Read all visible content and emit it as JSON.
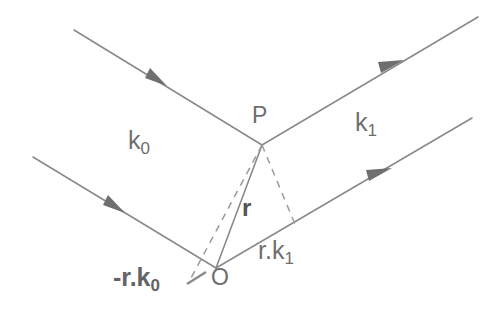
{
  "figure": {
    "type": "scattering-geometry-diagram",
    "background_color": "#ffffff",
    "line_color": "#8a8a8a",
    "text_color": "#6e6e6e"
  },
  "labels": {
    "incident_wavevector": {
      "base": "k",
      "sub": "0",
      "x": 128,
      "y": 128
    },
    "scattered_wavevector": {
      "base": "k",
      "sub": "1",
      "x": 355,
      "y": 110
    },
    "point_p": {
      "text": "P",
      "x": 252,
      "y": 104
    },
    "point_o": {
      "text": "O",
      "x": 211,
      "y": 266
    },
    "position_vector": {
      "text": "r",
      "x": 242,
      "y": 196
    },
    "path_diff_incident": {
      "base": "-r.k",
      "sub": "0",
      "x": 113,
      "y": 265
    },
    "path_diff_scattered": {
      "base": "r.k",
      "sub": "1",
      "x": 258,
      "y": 238
    }
  },
  "points": {
    "P": {
      "x": 262,
      "y": 145
    },
    "O": {
      "x": 216,
      "y": 268
    },
    "foot_incident": {
      "x": 190,
      "y": 280
    },
    "foot_scattered": {
      "x": 297,
      "y": 229
    }
  },
  "rays": [
    {
      "name": "incident-ray-upper",
      "x1": 74,
      "y1": 30,
      "x2": 262,
      "y2": 145,
      "arrow_t": 0.43,
      "style": "solid"
    },
    {
      "name": "scattered-ray-upper",
      "x1": 262,
      "y1": 145,
      "x2": 478,
      "y2": 17,
      "arrow_t": 0.6,
      "style": "solid"
    },
    {
      "name": "incident-ray-lower",
      "x1": 33,
      "y1": 157,
      "x2": 216,
      "y2": 268,
      "arrow_t": 0.43,
      "style": "solid"
    },
    {
      "name": "scattered-ray-lower",
      "x1": 216,
      "y1": 268,
      "x2": 472,
      "y2": 118,
      "arrow_t": 0.635,
      "style": "solid"
    }
  ],
  "construction_lines": [
    {
      "name": "position-vector-r",
      "x1": 262,
      "y1": 145,
      "x2": 216,
      "y2": 268,
      "style": "solid"
    },
    {
      "name": "perpendicular-to-incident",
      "x1": 262,
      "y1": 145,
      "x2": 190,
      "y2": 280,
      "style": "dashed"
    },
    {
      "name": "perpendicular-to-scattered",
      "x1": 262,
      "y1": 145,
      "x2": 297,
      "y2": 229,
      "style": "dashed"
    },
    {
      "name": "incident-extension-stub",
      "x1": 205,
      "y1": 271,
      "x2": 186,
      "y2": 283,
      "style": "solid"
    }
  ]
}
